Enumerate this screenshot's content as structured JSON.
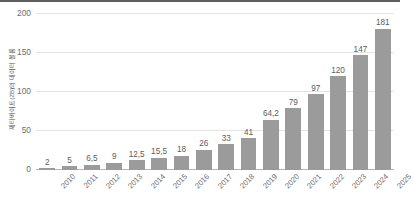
{
  "chart_data": {
    "type": "bar",
    "title": "",
    "subtitle": "",
    "xlabel": "",
    "ylabel": "제타바이트(ZB)의 데이터 볼륨",
    "categories": [
      "2010",
      "2011",
      "2012",
      "2013",
      "2014",
      "2015",
      "2016",
      "2017",
      "2018",
      "2019",
      "2020",
      "2021",
      "2022",
      "2023",
      "2024",
      "2025"
    ],
    "values": [
      2,
      5,
      6.5,
      9,
      12.5,
      15.5,
      18,
      26,
      33,
      41,
      64.2,
      79,
      97,
      120,
      147,
      181
    ],
    "value_labels": [
      "2",
      "5",
      "6,5",
      "9",
      "12,5",
      "15,5",
      "18",
      "26",
      "33",
      "41",
      "64,2",
      "79",
      "97",
      "120",
      "147",
      "181"
    ],
    "ylim": [
      0,
      200
    ],
    "y_ticks": [
      0,
      50,
      100,
      150,
      200
    ],
    "y_tick_labels": [
      "0",
      "50",
      "100",
      "150",
      "200"
    ],
    "grid": true,
    "legend": "none",
    "series": [
      {
        "name": "데이터 볼륨",
        "values": [
          2,
          5,
          6.5,
          9,
          12.5,
          15.5,
          18,
          26,
          33,
          41,
          64.2,
          79,
          97,
          120,
          147,
          181
        ]
      }
    ]
  },
  "style": {
    "bar_color": "#9b9b9b",
    "grid_color": "#e3e3e3",
    "axis_color": "#b4b4b4",
    "text_color": "#6d6d6f",
    "value_text_color": "#5c5c5e",
    "background": "#ffffff",
    "top_rule_color": "#5f5f5f"
  }
}
